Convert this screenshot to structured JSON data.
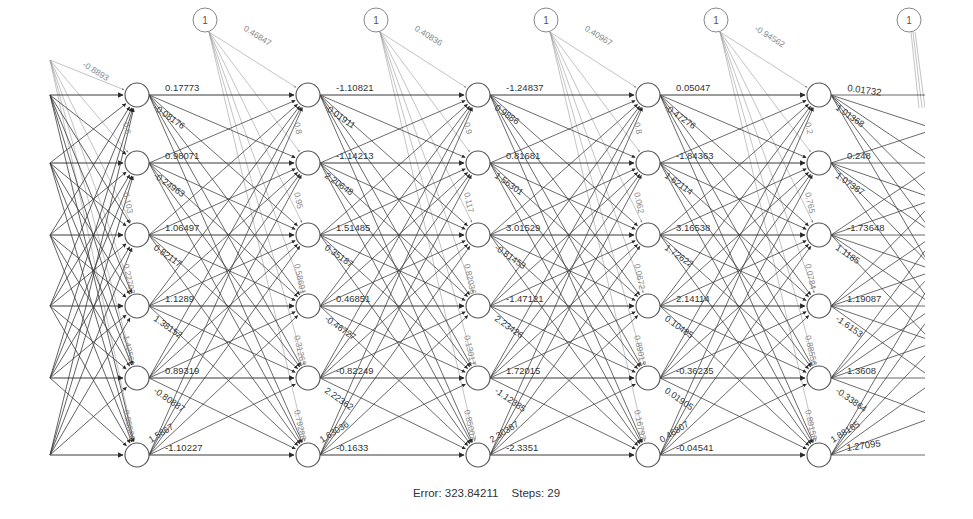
{
  "diagram": {
    "type": "neural-network-plot",
    "layers": [
      {
        "x": 137,
        "neurons": 6
      },
      {
        "x": 308,
        "neurons": 6
      },
      {
        "x": 478,
        "neurons": 6
      },
      {
        "x": 648,
        "neurons": 6
      },
      {
        "x": 819,
        "neurons": 6
      }
    ],
    "row_y": [
      95,
      163,
      235,
      306,
      378,
      455
    ],
    "input_start_x": 50,
    "right_clip_x": 925,
    "neuron_radius": 12,
    "bias_nodes": [
      {
        "x": 205,
        "y": 20,
        "label": "1",
        "weight": "0.46847"
      },
      {
        "x": 376,
        "y": 20,
        "label": "1",
        "weight": "0.40836"
      },
      {
        "x": 546,
        "y": 20,
        "label": "1",
        "weight": "0.40967"
      },
      {
        "x": 716,
        "y": 20,
        "label": "1",
        "weight": "-0.94562"
      },
      {
        "x": 909,
        "y": 20,
        "label": "1",
        "weight": ""
      }
    ],
    "input_bias_label": "-0.8893",
    "horizontal_weights": [
      [
        "0.17773",
        "0.98071",
        "1.06497",
        "1.1289",
        "0.89319",
        "-1.10227"
      ],
      [
        "-1.10821",
        "-1.14213",
        "1.51485",
        "0.46851",
        "-0.82249",
        "-0.1633"
      ],
      [
        "-1.24837",
        "0.81681",
        "3.01529",
        "-1.47121",
        "1.72015",
        "-2.3351"
      ],
      [
        "0.05047",
        "-1.84363",
        "3.16538",
        "2.14114",
        "-0.36235",
        "-0.04541"
      ],
      [
        "0.01732",
        "0.248",
        "-1.73648",
        "1.19087",
        "1.3608",
        "1.27095"
      ]
    ],
    "diagonal_weights": [
      [
        "-0.08176",
        "-0.24963",
        "0.82117",
        "1.38152",
        "-0.80887",
        "1.5867"
      ],
      [
        "-0.01911",
        "2.20648",
        "0.35187",
        "-0.46727",
        "2.22362",
        "1.63036"
      ],
      [
        "0.9886",
        "1.56301",
        "-0.81453",
        "2.23426",
        "-1.12385",
        "2.30387"
      ],
      [
        "-0.47276",
        "1.62114",
        "1.72622",
        "0.10485",
        "0.01905",
        "0.46807"
      ],
      [
        "1.01368",
        "1.07387",
        "1.1185",
        "-1.6153",
        "-0.33864",
        "1.88185"
      ]
    ],
    "vertical_bias_labels": [
      [
        "",
        "0.6",
        "0.103",
        "0.22703",
        "1.42561",
        "0.85526"
      ],
      [
        "",
        "0.8",
        "0.95",
        "0.58691",
        "0.31263",
        "0.79288"
      ],
      [
        "",
        "0.9",
        "0.117",
        "0.82036",
        "0.13017",
        "0.85007"
      ],
      [
        "",
        "0.8",
        "0.062",
        "0.0672",
        "0.89013",
        "0.16797"
      ],
      [
        "",
        "0.2",
        "0.765",
        "0.0784",
        "0.88556",
        "0.89158"
      ]
    ]
  },
  "footer": {
    "error_label": "Error: 323.84211",
    "steps_label": "Steps: 29"
  },
  "colors": {
    "line": "#3a3a3a",
    "bias_line": "#9a9a9a",
    "node_stroke": "#555555",
    "text": "#333333",
    "bias_text": "#888888"
  }
}
